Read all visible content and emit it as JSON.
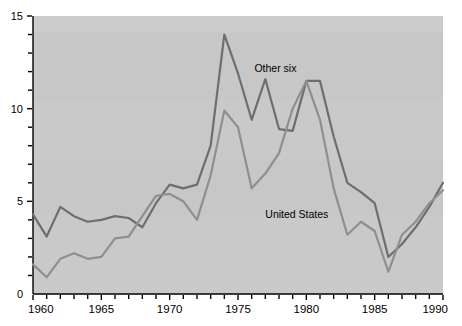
{
  "chart_data": {
    "type": "line",
    "title": "",
    "subtitle": "",
    "xlabel": "",
    "ylabel": "",
    "xlim": [
      1960,
      1990
    ],
    "ylim": [
      0,
      15
    ],
    "grid": false,
    "legend_position": "inline-annotation",
    "background": "#c9c9c9",
    "x_tick_labels": [
      "1960",
      "1965",
      "1970",
      "1975",
      "1980",
      "1985",
      "1990"
    ],
    "x_tick_values": [
      1960,
      1965,
      1970,
      1975,
      1980,
      1985,
      1990
    ],
    "x_minor_step": 1,
    "y_tick_labels": [
      "0",
      "5",
      "10",
      "15"
    ],
    "y_tick_values": [
      0,
      5,
      10,
      15
    ],
    "y_minor_step": 1,
    "x": [
      1960,
      1961,
      1962,
      1963,
      1964,
      1965,
      1966,
      1967,
      1968,
      1969,
      1970,
      1971,
      1972,
      1973,
      1974,
      1975,
      1976,
      1977,
      1978,
      1979,
      1980,
      1981,
      1982,
      1983,
      1984,
      1985,
      1986,
      1987,
      1988,
      1989,
      1990
    ],
    "series": [
      {
        "name": "Other six",
        "color": "#6e6e6e",
        "annotation": "Other six",
        "annotation_x": 1976.2,
        "annotation_y": 12.0,
        "values": [
          4.3,
          3.1,
          4.7,
          4.2,
          3.9,
          4.0,
          4.2,
          4.1,
          3.6,
          4.9,
          5.9,
          5.7,
          5.9,
          8.0,
          14.0,
          11.9,
          9.4,
          11.6,
          8.9,
          8.8,
          11.5,
          11.5,
          8.5,
          6.0,
          5.5,
          4.9,
          2.0,
          2.7,
          3.6,
          4.7,
          6.0
        ]
      },
      {
        "name": "United States",
        "color": "#8f8f8f",
        "annotation": "United States",
        "annotation_x": 1977.0,
        "annotation_y": 4.1,
        "values": [
          1.6,
          0.9,
          1.9,
          2.2,
          1.9,
          2.0,
          3.0,
          3.1,
          4.2,
          5.3,
          5.4,
          5.0,
          4.0,
          6.4,
          9.9,
          9.0,
          5.7,
          6.5,
          7.6,
          10.0,
          11.5,
          9.4,
          5.7,
          3.2,
          3.9,
          3.4,
          1.2,
          3.2,
          3.9,
          4.9,
          5.6
        ]
      }
    ]
  },
  "axes": {
    "y_labels": [
      "15",
      "10",
      "5",
      "0"
    ],
    "x_labels": [
      "1960",
      "1965",
      "1970",
      "1975",
      "1980",
      "1985",
      "1990"
    ]
  },
  "annotations": {
    "other_six": "Other six",
    "united_states": "United States"
  }
}
